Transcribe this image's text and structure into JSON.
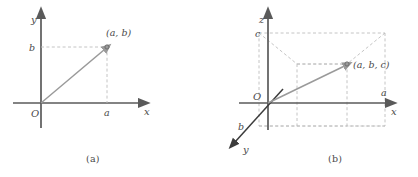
{
  "figure": {
    "background_color": "#ffffff",
    "axis_color": "#5a5a5a",
    "dash_color": "#bdbdbd",
    "vector_color": "#9a9a9a",
    "label_color": "#4a4a4a",
    "dark_line_color": "#3c3c3c"
  },
  "panel_a": {
    "caption": "(a)",
    "axes": [
      {
        "name": "x-axis",
        "label": "x"
      },
      {
        "name": "y-axis",
        "label": "y"
      }
    ],
    "origin_label": "O",
    "tick_x_label": "a",
    "tick_y_label": "b",
    "point_label": "(a, b)",
    "point_marker": "open-circle",
    "vector_from": "O",
    "vector_to": "(a, b)"
  },
  "panel_b": {
    "caption": "(b)",
    "axes": [
      {
        "name": "x-axis",
        "label": "x"
      },
      {
        "name": "y-axis",
        "label": "y"
      },
      {
        "name": "z-axis",
        "label": "z"
      }
    ],
    "origin_label": "O",
    "tick_x_label": "a",
    "tick_y_label": "b",
    "tick_z_label": "c",
    "point_label": "(a, b, c)",
    "point_marker": "open-circle",
    "vector_from": "O",
    "vector_to": "(a, b, c)"
  }
}
